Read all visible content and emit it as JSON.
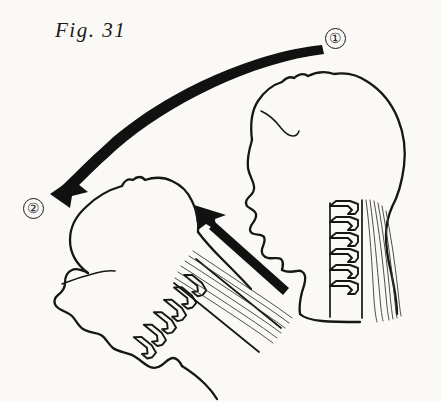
{
  "figure": {
    "caption": "Fig. 31",
    "background_color": "#faf9f6",
    "ink_color": "#161616",
    "width": 441,
    "height": 402
  },
  "markers": [
    {
      "id": "one",
      "label": "①",
      "meaning": "starting-position-head-upright",
      "x": 335,
      "y": 38
    },
    {
      "id": "two",
      "label": "②",
      "meaning": "end-position-head-flexed-forward",
      "x": 33,
      "y": 208
    }
  ],
  "arrows": [
    {
      "id": "rotation-arrow",
      "type": "curved",
      "label": "motion-path-from-position-1-to-position-2",
      "from_marker": "one",
      "to_marker": "two",
      "start": [
        322,
        46
      ],
      "end": [
        56,
        191
      ],
      "direction": "clockwise-sweep-left-and-down"
    },
    {
      "id": "traction-arrow",
      "type": "straight",
      "label": "muscle-traction-direction",
      "start": [
        288,
        287
      ],
      "end": [
        196,
        206
      ],
      "direction": "up-left"
    }
  ],
  "figures": [
    {
      "id": "head-upright",
      "label": "head-and-neck-upright-profile",
      "position_marker": "one",
      "facing": "left",
      "rotation_deg": 0,
      "parts": [
        "skull",
        "face-profile",
        "hairline",
        "cervical-vertebrae",
        "neck-muscles",
        "jaw",
        "throat"
      ],
      "vertebra_count": 6
    },
    {
      "id": "head-flexed",
      "label": "head-and-neck-flexed-forward",
      "position_marker": "two",
      "facing": "down-left",
      "rotation_deg": 62,
      "parts": [
        "skull",
        "face-profile",
        "brow-line",
        "cervical-vertebrae",
        "neck-muscles",
        "jaw",
        "throat"
      ],
      "vertebra_count": 6
    }
  ]
}
